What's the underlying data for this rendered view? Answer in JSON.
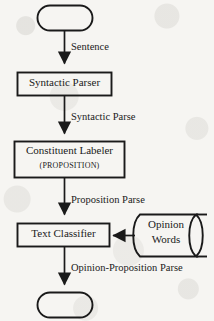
{
  "diagram": {
    "background_color": "#f6f5f2",
    "stroke_color": "#1a1a1a",
    "nodes": [
      {
        "id": "start",
        "shape": "terminator",
        "label": "",
        "x": 37,
        "y": 5,
        "w": 56,
        "h": 26
      },
      {
        "id": "syntactic_parser",
        "shape": "process",
        "label": "Syntactic Parser",
        "x": 17,
        "y": 72,
        "w": 95,
        "h": 24
      },
      {
        "id": "constituent_labeler",
        "shape": "process",
        "label": "Constituent Labeler",
        "sublabel": "(PROPOSITION)",
        "x": 14,
        "y": 141,
        "w": 111,
        "h": 37
      },
      {
        "id": "text_classifier",
        "shape": "process",
        "label": "Text Classifier",
        "x": 17,
        "y": 223,
        "w": 93,
        "h": 24
      },
      {
        "id": "opinion_words",
        "shape": "stored-data",
        "label_line_1": "Opinion",
        "label_line_2": "Words",
        "x": 133,
        "y": 214,
        "w": 75,
        "h": 42
      },
      {
        "id": "end",
        "shape": "terminator",
        "label": "",
        "x": 37,
        "y": 292,
        "w": 56,
        "h": 26
      }
    ],
    "edges": [
      {
        "id": "e1",
        "from": "start",
        "to": "syntactic_parser",
        "label": "Sentence",
        "direction": "down"
      },
      {
        "id": "e2",
        "from": "syntactic_parser",
        "to": "constituent_labeler",
        "label": "Syntactic Parse",
        "direction": "down"
      },
      {
        "id": "e3",
        "from": "constituent_labeler",
        "to": "text_classifier",
        "label": "Proposition Parse",
        "direction": "down"
      },
      {
        "id": "e4",
        "from": "opinion_words",
        "to": "text_classifier",
        "label": "",
        "direction": "left"
      },
      {
        "id": "e5",
        "from": "text_classifier",
        "to": "end",
        "label": "Opinion-Proposition Parse",
        "direction": "down"
      }
    ]
  }
}
